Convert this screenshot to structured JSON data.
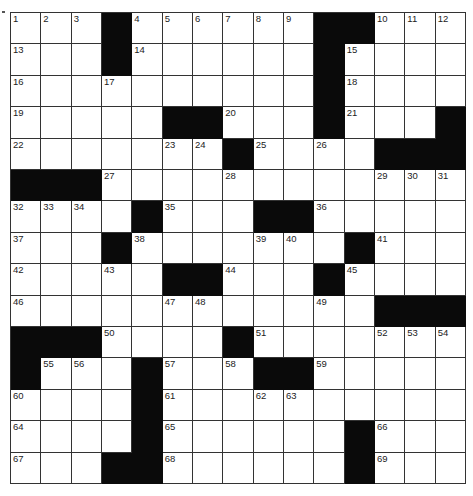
{
  "puzzle": {
    "rows": 15,
    "cols": 15,
    "colors": {
      "block": "#0a0a0a",
      "cell": "#ffffff",
      "line": "#333333"
    },
    "grid": [
      [
        1,
        2,
        3,
        "#",
        4,
        5,
        6,
        7,
        8,
        9,
        "#",
        "#",
        10,
        11,
        12
      ],
      [
        13,
        0,
        0,
        "#",
        14,
        0,
        0,
        0,
        0,
        0,
        "#",
        15,
        0,
        0,
        0
      ],
      [
        16,
        0,
        0,
        17,
        0,
        0,
        0,
        0,
        0,
        0,
        "#",
        18,
        0,
        0,
        0
      ],
      [
        19,
        0,
        0,
        0,
        0,
        "#",
        "#",
        20,
        0,
        0,
        "#",
        21,
        0,
        0,
        "#"
      ],
      [
        22,
        0,
        0,
        0,
        0,
        23,
        24,
        "#",
        25,
        0,
        26,
        0,
        "#",
        "#",
        "#"
      ],
      [
        "#",
        "#",
        "#",
        27,
        0,
        0,
        0,
        28,
        0,
        0,
        0,
        0,
        29,
        30,
        31
      ],
      [
        32,
        33,
        34,
        0,
        "#",
        35,
        0,
        0,
        "#",
        "#",
        36,
        0,
        0,
        0,
        0
      ],
      [
        37,
        0,
        0,
        "#",
        38,
        0,
        0,
        0,
        39,
        40,
        0,
        "#",
        41,
        0,
        0
      ],
      [
        42,
        0,
        0,
        43,
        0,
        "#",
        "#",
        44,
        0,
        0,
        "#",
        45,
        0,
        0,
        0
      ],
      [
        46,
        0,
        0,
        0,
        0,
        47,
        48,
        0,
        0,
        0,
        49,
        0,
        "#",
        "#",
        "#"
      ],
      [
        "#",
        "#",
        "#",
        50,
        0,
        0,
        0,
        "#",
        51,
        0,
        0,
        0,
        52,
        53,
        54
      ],
      [
        "#",
        55,
        56,
        0,
        "#",
        57,
        0,
        58,
        "#",
        "#",
        59,
        0,
        0,
        0,
        0
      ],
      [
        60,
        0,
        0,
        0,
        "#",
        61,
        0,
        0,
        62,
        63,
        0,
        0,
        0,
        0,
        0
      ],
      [
        64,
        0,
        0,
        0,
        "#",
        65,
        0,
        0,
        0,
        0,
        0,
        "#",
        66,
        0,
        0
      ],
      [
        67,
        0,
        0,
        "#",
        "#",
        68,
        0,
        0,
        0,
        0,
        0,
        "#",
        69,
        0,
        0
      ]
    ]
  }
}
